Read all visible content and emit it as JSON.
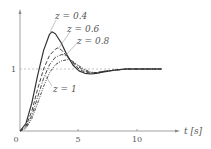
{
  "chart_data": {
    "type": "line",
    "title": "",
    "xlabel": "t [s]",
    "ylabel": "",
    "xlim": [
      0,
      13.5
    ],
    "ylim": [
      0,
      2
    ],
    "xticks": [
      "0",
      "5",
      "10"
    ],
    "yticks": [
      "1"
    ],
    "reference_line": {
      "y": 1,
      "style": "dashed"
    },
    "grid": false,
    "series": [
      {
        "name": "z = 0.4",
        "style": "solid",
        "x": [
          0,
          0.5,
          1,
          1.5,
          2,
          2.5,
          2.7,
          3,
          3.5,
          4,
          4.5,
          5,
          5.5,
          6,
          6.5,
          7,
          8,
          9,
          10,
          11,
          12
        ],
        "values": [
          0,
          0.12,
          0.45,
          0.9,
          1.3,
          1.56,
          1.6,
          1.57,
          1.42,
          1.22,
          1.06,
          0.97,
          0.93,
          0.92,
          0.93,
          0.95,
          0.98,
          1.0,
          1.0,
          1.0,
          1.0
        ]
      },
      {
        "name": "z = 0.6",
        "style": "dashed",
        "x": [
          0,
          0.5,
          1,
          1.5,
          2,
          2.5,
          3,
          3.2,
          3.5,
          4,
          4.5,
          5,
          5.5,
          6,
          6.5,
          7,
          8,
          9,
          10,
          11,
          12
        ],
        "values": [
          0,
          0.08,
          0.32,
          0.68,
          1.0,
          1.22,
          1.32,
          1.34,
          1.31,
          1.2,
          1.09,
          1.0,
          0.95,
          0.93,
          0.94,
          0.96,
          0.98,
          1.0,
          1.0,
          1.0,
          1.0
        ]
      },
      {
        "name": "z = 0.8",
        "style": "dashdot",
        "x": [
          0,
          0.5,
          1,
          1.5,
          2,
          2.5,
          3,
          3.5,
          3.7,
          4,
          4.5,
          5,
          5.5,
          6,
          6.5,
          7,
          8,
          9,
          10,
          11,
          12
        ],
        "values": [
          0,
          0.06,
          0.25,
          0.55,
          0.85,
          1.07,
          1.19,
          1.23,
          1.23,
          1.2,
          1.11,
          1.03,
          0.97,
          0.94,
          0.94,
          0.96,
          0.98,
          1.0,
          1.0,
          1.0,
          1.0
        ]
      },
      {
        "name": "z = 1",
        "style": "dashdotdot",
        "x": [
          0,
          0.5,
          1,
          1.5,
          2,
          2.5,
          3,
          3.5,
          4,
          4.2,
          4.5,
          5,
          5.5,
          6,
          6.5,
          7,
          8,
          9,
          10,
          11,
          12
        ],
        "values": [
          0,
          0.04,
          0.2,
          0.45,
          0.72,
          0.94,
          1.07,
          1.13,
          1.15,
          1.15,
          1.12,
          1.05,
          0.99,
          0.95,
          0.94,
          0.96,
          0.98,
          1.0,
          1.0,
          1.0,
          1.0
        ]
      }
    ],
    "annotations": [
      "z = 0.4",
      "z = 0.6",
      "z = 0.8",
      "z = 1"
    ]
  },
  "labels": {
    "z04": "z = 0.4",
    "z06": "z = 0.6",
    "z08": "z = 0.8",
    "z1": "z = 1",
    "xaxis": "t [s]",
    "tick0": "0",
    "tick5": "5",
    "tick10": "10",
    "y1": "1"
  }
}
